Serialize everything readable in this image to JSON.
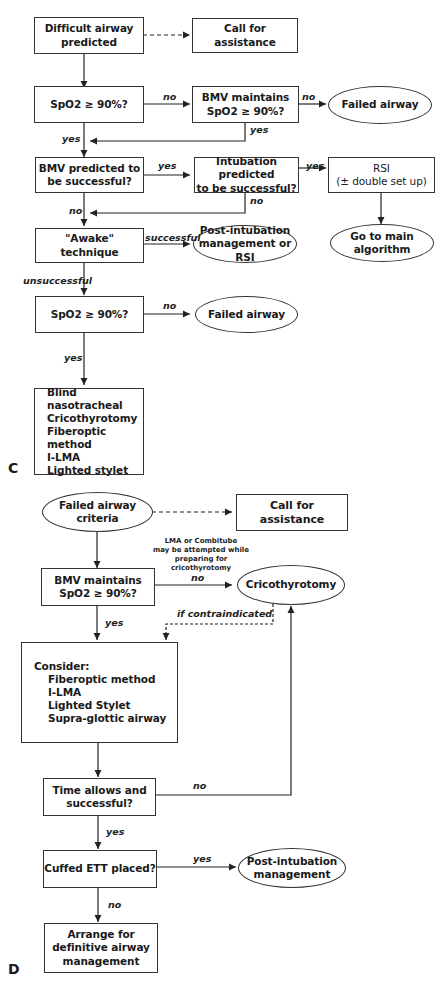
{
  "panel_c": {
    "label": "C",
    "nodes": {
      "difficult_airway": "Difficult airway\npredicted",
      "call_assist": "Call for assistance",
      "spo2_check_1": "SpO2 ≥ 90%?",
      "bmv_maintains": "BMV maintains\nSpO2 ≥ 90%?",
      "failed_airway_1": "Failed airway",
      "bmv_predicted": "BMV predicted to\nbe successful?",
      "intubation_predicted": "Intubation predicted\nto be successful?",
      "rsi": "RSI\n(± double set up)",
      "awake": "\"Awake\"\ntechnique",
      "post_intubation_rsi": "Post-intubation\nmanagement or RSI",
      "main_algorithm": "Go to main\nalgorithm",
      "spo2_check_2": "SpO2 ≥ 90%?",
      "failed_airway_2": "Failed airway",
      "options": [
        "Blind nasotracheal",
        "Cricothyrotomy",
        "Fiberoptic method",
        "I-LMA",
        "Lighted stylet"
      ]
    },
    "edges": {
      "no_1": "no",
      "no_2": "no",
      "yes_1": "yes",
      "yes_2": "yes",
      "yes_3": "yes",
      "yes_4": "yes",
      "no_3": "no",
      "no_4": "no",
      "successful": "successful",
      "unsuccessful": "unsuccessful",
      "no_5": "no",
      "yes_5": "yes"
    }
  },
  "panel_d": {
    "label": "D",
    "nodes": {
      "failed_criteria": "Failed airway\ncriteria",
      "call_assist": "Call for assistance",
      "note": "LMA or Combitube\nmay be attempted while\npreparing for cricothyrotomy",
      "bmv_maintains": "BMV maintains\nSpO2 ≥ 90%?",
      "cricothyrotomy": "Cricothyrotomy",
      "consider_title": "Consider:",
      "consider_items": [
        "Fiberoptic method",
        "I-LMA",
        "Lighted Stylet",
        "Supra-glottic airway"
      ],
      "time_allows": "Time allows and\nsuccessful?",
      "cuffed_ett": "Cuffed ETT placed?",
      "post_intubation": "Post-intubation\nmanagement",
      "arrange": "Arrange for\ndefinitive airway\nmanagement"
    },
    "edges": {
      "no_1": "no",
      "if_contraindicated": "if contraindicated",
      "yes_1": "yes",
      "no_2": "no",
      "yes_2": "yes",
      "yes_3": "yes",
      "no_3": "no"
    }
  }
}
